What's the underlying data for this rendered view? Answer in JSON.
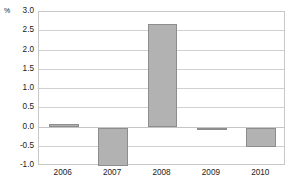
{
  "chart_data": {
    "type": "bar",
    "title": "",
    "subtitle": "",
    "xlabel": "",
    "ylabel": "%",
    "unit_label": "%",
    "categories": [
      "2006",
      "2007",
      "2008",
      "2009",
      "2010"
    ],
    "values": [
      0.1,
      -1.0,
      2.7,
      -0.05,
      -0.5
    ],
    "series": [
      {
        "name": "",
        "values": [
          0.1,
          -1.0,
          2.7,
          -0.05,
          -0.5
        ]
      }
    ],
    "ylim": [
      -1.0,
      3.0
    ],
    "y_ticks": [
      3.0,
      2.5,
      2.0,
      1.5,
      1.0,
      0.5,
      0.0,
      -0.5,
      -1.0
    ],
    "y_tick_labels": [
      "3.0",
      "2.5",
      "2.0",
      "1.5",
      "1.0",
      "0.5",
      "0.0",
      "-0.5",
      "-1.0"
    ],
    "x_tick_labels": [
      "2006",
      "2007",
      "2008",
      "2009",
      "2010"
    ],
    "grid": true,
    "grid_orientation": "horizontal",
    "legend": false,
    "legend_position": "none",
    "annotations": [],
    "colors": {
      "bar_fill": "#b2b2b2",
      "bar_border": "#8d8d8d",
      "gridline": "#d0d0d0",
      "plot_border": "#c9c9c9",
      "text": "#1a1a1a",
      "background": "#ffffff"
    }
  }
}
